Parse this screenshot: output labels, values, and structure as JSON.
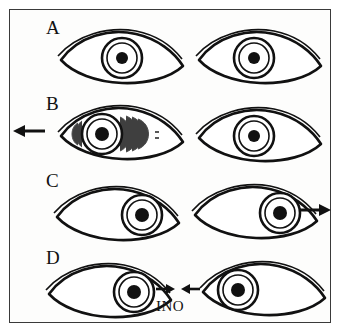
{
  "figure": {
    "caption": "INO",
    "border_color": "#3a3a3a",
    "background_color": "#fdfdfc",
    "ink_color": "#111111"
  },
  "rows": [
    {
      "label": "A",
      "left_eye": {
        "gaze": "center",
        "nystagmus": false
      },
      "right_eye": {
        "gaze": "center",
        "nystagmus": false
      },
      "arrow": {
        "present": false,
        "direction": "",
        "side": ""
      }
    },
    {
      "label": "B",
      "left_eye": {
        "gaze": "left",
        "nystagmus": true
      },
      "right_eye": {
        "gaze": "center",
        "nystagmus": false
      },
      "arrow": {
        "present": true,
        "direction": "left",
        "side": "left"
      }
    },
    {
      "label": "C",
      "left_eye": {
        "gaze": "right",
        "nystagmus": false
      },
      "right_eye": {
        "gaze": "right",
        "nystagmus": false
      },
      "arrow": {
        "present": true,
        "direction": "right",
        "side": "right"
      }
    },
    {
      "label": "D",
      "left_eye": {
        "gaze": "right",
        "nystagmus": false
      },
      "right_eye": {
        "gaze": "left",
        "nystagmus": false
      },
      "arrow": {
        "present": true,
        "direction": "converge",
        "side": "center"
      }
    }
  ]
}
